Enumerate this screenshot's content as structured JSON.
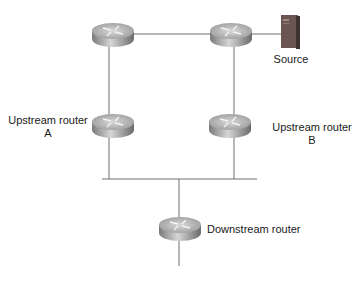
{
  "diagram": {
    "type": "network-topology",
    "colors": {
      "link": "#6e6e6e",
      "router_top": "#bfbfbf",
      "router_side": "#8c8c8c",
      "server_body": "#6b5552",
      "label": "#1a1a1a"
    },
    "nodes": [
      {
        "id": "router-top-left",
        "kind": "router",
        "label": ""
      },
      {
        "id": "router-top-right",
        "kind": "router",
        "label": ""
      },
      {
        "id": "source",
        "kind": "server",
        "label": "Source"
      },
      {
        "id": "upstream-a",
        "kind": "router",
        "label_line1": "Upstream router",
        "label_line2": "A"
      },
      {
        "id": "upstream-b",
        "kind": "router",
        "label_line1": "Upstream router",
        "label_line2": "B"
      },
      {
        "id": "downstream",
        "kind": "router",
        "label": "Downstream router"
      }
    ],
    "links": [
      {
        "from": "router-top-left",
        "to": "router-top-right"
      },
      {
        "from": "router-top-right",
        "to": "source"
      },
      {
        "from": "router-top-left",
        "to": "upstream-a"
      },
      {
        "from": "router-top-right",
        "to": "upstream-b"
      },
      {
        "from": "upstream-a",
        "to": "lan-segment"
      },
      {
        "from": "upstream-b",
        "to": "lan-segment"
      },
      {
        "from": "lan-segment",
        "to": "downstream"
      },
      {
        "from": "downstream",
        "to": "downstream-stub"
      }
    ]
  }
}
